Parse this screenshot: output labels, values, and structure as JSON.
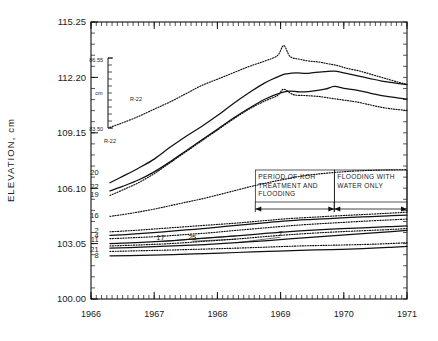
{
  "chart_data": {
    "type": "line",
    "title": "",
    "xlabel": "",
    "ylabel": "ELEVATION, cm",
    "xlim": [
      1966.0,
      1971.0
    ],
    "ylim": [
      100.0,
      115.25
    ],
    "xtick_labels": [
      "1966",
      "1967",
      "1968",
      "1969",
      "1970",
      "1971"
    ],
    "ytick_labels": [
      "100.00",
      "103.05",
      "106.10",
      "109.15",
      "112.20",
      "115.25"
    ],
    "ytick_values": [
      100.0,
      103.05,
      106.1,
      109.15,
      112.2,
      115.25
    ],
    "xtick_values": [
      1966,
      1967,
      1968,
      1969,
      1970,
      1971
    ],
    "grid": false,
    "legend": "inline series labels at left edge of each curve",
    "minor_ticks": "monthly on x-axis, subdivisions on y-axis",
    "secondary_axis": {
      "name": "R-22",
      "top_label": "86.55",
      "bottom_label": "83.50",
      "unit": "cm",
      "caption": "R-22",
      "tick_count": 10
    },
    "annotations": [
      {
        "name": "period-koh",
        "text": "PERIOD OF KOH TREATMENT AND FLOODING",
        "lines": [
          "PERIOD OF KOH",
          "TREATMENT AND",
          "FLOODING"
        ],
        "x_start": 1968.6,
        "x_end": 1969.85
      },
      {
        "name": "flooding-water",
        "text": "FLOODING WITH WATER ONLY",
        "lines": [
          "FLOODING WITH",
          "WATER ONLY"
        ],
        "x_start": 1969.85,
        "x_end": 1971.0
      }
    ],
    "series": [
      {
        "name": "20",
        "style": "solid",
        "label_x": 1966.12,
        "label_y": 106.95,
        "x": [
          1966.3,
          1966.5,
          1966.75,
          1967.0,
          1967.25,
          1967.5,
          1967.75,
          1968.0,
          1968.25,
          1968.5,
          1968.75,
          1969.0,
          1969.1,
          1969.25,
          1969.4,
          1969.55,
          1969.7,
          1969.85,
          1970.0,
          1970.2,
          1970.4,
          1970.6,
          1970.8,
          1971.0
        ],
        "y": [
          106.4,
          106.75,
          107.2,
          107.7,
          108.35,
          108.95,
          109.5,
          110.1,
          110.75,
          111.35,
          111.9,
          112.3,
          112.4,
          112.45,
          112.42,
          112.48,
          112.52,
          112.55,
          112.45,
          112.3,
          112.15,
          112.0,
          111.9,
          111.8
        ]
      },
      {
        "name": "R-22-upper",
        "style": "dotted",
        "label_x": 1966.3,
        "label_y": 109.55,
        "x": [
          1966.3,
          1966.5,
          1966.75,
          1967.0,
          1967.25,
          1967.5,
          1967.75,
          1968.0,
          1968.25,
          1968.5,
          1968.75,
          1968.95,
          1969.05,
          1969.15,
          1969.3,
          1969.45,
          1969.6,
          1969.75,
          1969.9,
          1970.05,
          1970.25,
          1970.45,
          1970.65,
          1970.85,
          1971.0
        ],
        "y": [
          109.45,
          109.7,
          110.05,
          110.45,
          110.85,
          111.3,
          111.75,
          112.1,
          112.45,
          112.8,
          113.1,
          113.4,
          113.95,
          113.35,
          113.2,
          113.1,
          113.05,
          112.95,
          112.85,
          112.7,
          112.55,
          112.35,
          112.15,
          111.95,
          111.82
        ]
      },
      {
        "name": "22",
        "style": "solid",
        "label_x": 1966.12,
        "label_y": 106.18,
        "x": [
          1966.3,
          1966.5,
          1966.75,
          1967.0,
          1967.25,
          1967.5,
          1967.75,
          1968.0,
          1968.25,
          1968.5,
          1968.75,
          1969.0,
          1969.15,
          1969.3,
          1969.5,
          1969.7,
          1969.85,
          1970.0,
          1970.2,
          1970.4,
          1970.6,
          1970.8,
          1971.0
        ],
        "y": [
          105.95,
          106.2,
          106.55,
          107.0,
          107.55,
          108.15,
          108.75,
          109.35,
          109.95,
          110.5,
          111.0,
          111.35,
          111.45,
          111.4,
          111.45,
          111.55,
          111.7,
          111.6,
          111.5,
          111.35,
          111.2,
          111.1,
          111.0
        ]
      },
      {
        "name": "19",
        "style": "dotted",
        "label_x": 1966.12,
        "label_y": 105.78,
        "x": [
          1966.3,
          1966.5,
          1966.75,
          1967.0,
          1967.25,
          1967.5,
          1967.75,
          1968.0,
          1968.25,
          1968.5,
          1968.75,
          1968.95,
          1969.05,
          1969.2,
          1969.4,
          1969.6,
          1969.8,
          1970.0,
          1970.2,
          1970.4,
          1970.6,
          1970.8,
          1971.0
        ],
        "y": [
          105.7,
          106.0,
          106.4,
          106.9,
          107.5,
          108.1,
          108.7,
          109.3,
          109.9,
          110.45,
          110.9,
          111.2,
          111.55,
          111.25,
          111.2,
          111.15,
          111.05,
          110.95,
          110.85,
          110.7,
          110.55,
          110.45,
          110.38
        ]
      },
      {
        "name": "16",
        "style": "dotted",
        "label_x": 1966.12,
        "label_y": 104.62,
        "x": [
          1966.3,
          1966.6,
          1967.0,
          1967.4,
          1967.8,
          1968.2,
          1968.6,
          1969.0,
          1969.4,
          1969.8,
          1970.2,
          1970.6,
          1971.0
        ],
        "y": [
          104.55,
          104.7,
          104.95,
          105.25,
          105.55,
          105.9,
          106.25,
          106.55,
          106.8,
          106.95,
          107.05,
          107.1,
          107.12
        ]
      },
      {
        "name": "2",
        "style": "dotted",
        "label_x": 1966.12,
        "label_y": 103.75,
        "x": [
          1966.3,
          1966.7,
          1967.1,
          1967.5,
          1967.9,
          1968.3,
          1968.7,
          1969.1,
          1969.5,
          1969.9,
          1970.3,
          1970.7,
          1971.0
        ],
        "y": [
          103.7,
          103.78,
          103.88,
          103.98,
          104.08,
          104.18,
          104.3,
          104.42,
          104.5,
          104.58,
          104.65,
          104.72,
          104.78
        ]
      },
      {
        "name": "4",
        "style": "solid",
        "label_x": 1966.12,
        "label_y": 103.52,
        "x": [
          1966.3,
          1966.7,
          1967.1,
          1967.5,
          1967.9,
          1968.3,
          1968.7,
          1969.1,
          1969.5,
          1969.9,
          1970.3,
          1970.7,
          1971.0
        ],
        "y": [
          103.5,
          103.58,
          103.68,
          103.8,
          103.92,
          104.05,
          104.18,
          104.3,
          104.38,
          104.45,
          104.52,
          104.58,
          104.62
        ]
      },
      {
        "name": "11",
        "style": "dotted",
        "label_x": 1966.12,
        "label_y": 103.28,
        "x": [
          1966.3,
          1966.7,
          1967.1,
          1967.5,
          1967.9,
          1968.3,
          1968.7,
          1969.1,
          1969.5,
          1969.9,
          1970.3,
          1970.7,
          1971.0
        ],
        "y": [
          103.32,
          103.38,
          103.45,
          103.55,
          103.65,
          103.78,
          103.9,
          104.02,
          104.12,
          104.2,
          104.28,
          104.35,
          104.4
        ]
      },
      {
        "name": "17",
        "style": "solid",
        "label_x": 1967.1,
        "label_y": 103.38,
        "x": [
          1966.3,
          1966.8,
          1967.3,
          1967.8,
          1968.3,
          1968.8,
          1969.3,
          1969.8,
          1970.3,
          1970.7,
          1971.0
        ],
        "y": [
          103.05,
          103.12,
          103.22,
          103.35,
          103.48,
          103.62,
          103.75,
          103.85,
          103.92,
          103.98,
          104.02
        ]
      },
      {
        "name": "25",
        "style": "dotted",
        "label_x": 1967.6,
        "label_y": 103.4,
        "x": [
          1966.3,
          1966.8,
          1967.3,
          1967.8,
          1968.3,
          1968.8,
          1969.3,
          1969.8,
          1970.3,
          1970.7,
          1971.0
        ],
        "y": [
          102.92,
          102.98,
          103.06,
          103.18,
          103.3,
          103.45,
          103.58,
          103.68,
          103.76,
          103.82,
          103.88
        ]
      },
      {
        "name": "7",
        "style": "solid",
        "label_x": 1969.0,
        "label_y": 103.62,
        "x": [
          1966.3,
          1966.8,
          1967.3,
          1967.8,
          1968.3,
          1968.8,
          1969.3,
          1969.8,
          1970.3,
          1970.7,
          1971.0
        ],
        "y": [
          102.8,
          102.85,
          102.92,
          103.0,
          103.1,
          103.22,
          103.35,
          103.48,
          103.6,
          103.7,
          103.78
        ]
      },
      {
        "name": "21",
        "style": "dotted",
        "label_x": 1966.12,
        "label_y": 102.72,
        "x": [
          1966.3,
          1966.8,
          1967.3,
          1967.8,
          1968.3,
          1968.8,
          1969.3,
          1969.8,
          1970.3,
          1970.7,
          1971.0
        ],
        "y": [
          102.62,
          102.66,
          102.7,
          102.75,
          102.8,
          102.86,
          102.92,
          102.96,
          103.0,
          103.05,
          103.1
        ]
      },
      {
        "name": "8",
        "style": "solid",
        "label_x": 1966.12,
        "label_y": 102.42,
        "x": [
          1966.3,
          1966.8,
          1967.3,
          1967.8,
          1968.3,
          1968.8,
          1969.3,
          1969.8,
          1970.3,
          1970.7,
          1971.0
        ],
        "y": [
          102.38,
          102.4,
          102.44,
          102.5,
          102.56,
          102.62,
          102.68,
          102.72,
          102.78,
          102.84,
          102.9
        ]
      }
    ]
  }
}
